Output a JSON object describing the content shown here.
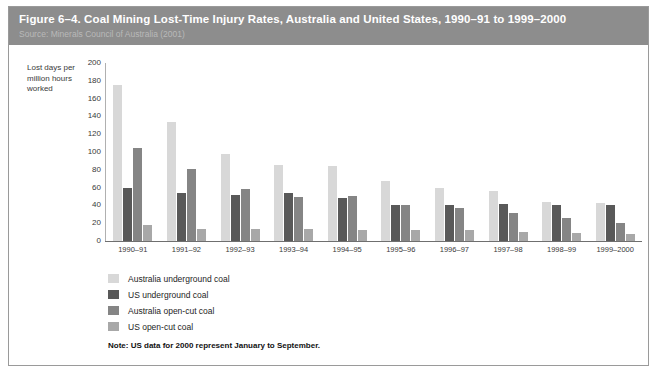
{
  "header": {
    "title": "Figure 6–4. Coal Mining Lost-Time Injury Rates, Australia and United States, 1990–91 to 1999–2000",
    "source": "Source: Minerals Council of Australia (2001)"
  },
  "note": "Note: US data for 2000 represent January to September.",
  "colors": {
    "header_band": "#8d8d8d",
    "australia_underground": "#d8d8d8",
    "us_underground": "#595959",
    "australia_opencut": "#858585",
    "us_opencut": "#a8a8a8",
    "axis": "#6f6f6f",
    "text": "#1e1e1e"
  },
  "chart_data": {
    "type": "bar",
    "title": "Figure 6–4. Coal Mining Lost-Time Injury Rates, Australia and United States, 1990–91 to 1999–2000",
    "subtitle": "Source: Minerals Council of Australia (2001)",
    "xlabel": "",
    "ylabel": "Lost days per million hours worked",
    "ylim": [
      0,
      200
    ],
    "yticks": [
      200,
      180,
      160,
      140,
      120,
      100,
      80,
      60,
      40,
      20,
      0
    ],
    "grid": false,
    "legend_position": "bottom-left",
    "categories": [
      "1990–91",
      "1991–92",
      "1992–93",
      "1993–94",
      "1994–95",
      "1995–96",
      "1996–97",
      "1997–98",
      "1998–99",
      "1999–2000"
    ],
    "series": [
      {
        "name": "Australia underground coal",
        "color": "#d8d8d8",
        "values": [
          175,
          134,
          98,
          85,
          84,
          67,
          60,
          56,
          44,
          43
        ]
      },
      {
        "name": "US underground coal",
        "color": "#595959",
        "values": [
          60,
          54,
          52,
          54,
          48,
          41,
          40,
          42,
          40,
          40
        ]
      },
      {
        "name": "Australia open-cut coal",
        "color": "#858585",
        "values": [
          104,
          81,
          59,
          49,
          51,
          40,
          37,
          31,
          26,
          20
        ]
      },
      {
        "name": "US open-cut coal",
        "color": "#a8a8a8",
        "values": [
          18,
          14,
          13,
          13,
          12,
          12,
          12,
          10,
          9,
          8
        ]
      }
    ]
  }
}
